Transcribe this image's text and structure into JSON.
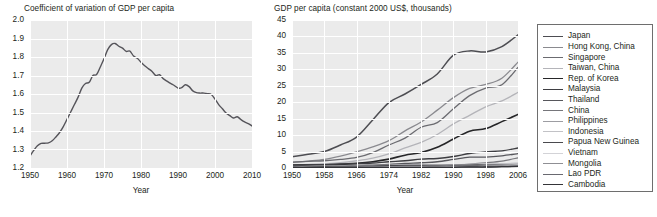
{
  "figure": {
    "background": "#ffffff",
    "plot_background": "#ebebeb",
    "gridline_color": "#ffffff",
    "text_color": "#231f20"
  },
  "chart_data": [
    {
      "id": "left",
      "type": "line",
      "title": "Coefficient of variation of GDP per capita",
      "xlabel": "Year",
      "ylabel": "",
      "xlim": [
        1950,
        2010
      ],
      "ylim": [
        1.2,
        2.0
      ],
      "xticks": [
        1950,
        1960,
        1970,
        1980,
        1990,
        2000,
        2010
      ],
      "xtick_labels": [
        "1950",
        "1960",
        "1970",
        "1980",
        "1990",
        "2000",
        "2010"
      ],
      "yticks": [
        1.2,
        1.3,
        1.4,
        1.5,
        1.6,
        1.7,
        1.8,
        1.9,
        2.0
      ],
      "ytick_labels": [
        "1.2",
        "1.3",
        "1.4",
        "1.5",
        "1.6",
        "1.7",
        "1.8",
        "1.9",
        "2.0"
      ],
      "grid": true,
      "legend": false,
      "series": [
        {
          "name": "Coefficient of variation of GDP per capita",
          "color": "#55545a",
          "width": 1.4,
          "x": [
            1950,
            1951,
            1952,
            1953,
            1954,
            1955,
            1956,
            1957,
            1958,
            1959,
            1960,
            1961,
            1962,
            1963,
            1964,
            1965,
            1966,
            1967,
            1968,
            1969,
            1970,
            1971,
            1972,
            1973,
            1974,
            1975,
            1976,
            1977,
            1978,
            1979,
            1980,
            1981,
            1982,
            1983,
            1984,
            1985,
            1986,
            1987,
            1988,
            1989,
            1990,
            1991,
            1992,
            1993,
            1994,
            1995,
            1996,
            1997,
            1998,
            1999,
            2000,
            2001,
            2002,
            2003,
            2004,
            2005,
            2006
          ],
          "values": [
            1.265,
            1.295,
            1.32,
            1.333,
            1.334,
            1.336,
            1.347,
            1.368,
            1.392,
            1.424,
            1.463,
            1.503,
            1.543,
            1.583,
            1.632,
            1.657,
            1.663,
            1.7,
            1.705,
            1.746,
            1.79,
            1.84,
            1.867,
            1.873,
            1.858,
            1.848,
            1.83,
            1.832,
            1.805,
            1.793,
            1.772,
            1.753,
            1.737,
            1.722,
            1.7,
            1.704,
            1.683,
            1.67,
            1.657,
            1.646,
            1.632,
            1.634,
            1.65,
            1.64,
            1.617,
            1.607,
            1.605,
            1.605,
            1.602,
            1.597,
            1.572,
            1.543,
            1.52,
            1.497,
            1.483,
            1.47,
            1.477
          ],
          "values_tail_x": [
            2007,
            2008,
            2009,
            2010,
            2011,
            2012
          ],
          "values_tail": [
            1.462,
            1.449,
            1.44,
            1.428,
            1.411,
            1.402
          ]
        }
      ]
    },
    {
      "id": "right",
      "type": "line",
      "title": "GDP per capita (constant 2000 US$, thousands)",
      "xlabel": "Year",
      "ylabel": "",
      "xlim": [
        1950,
        2006
      ],
      "ylim": [
        0,
        45
      ],
      "xticks": [
        1950,
        1958,
        1966,
        1974,
        1982,
        1990,
        1998,
        2006
      ],
      "xtick_labels": [
        "1950",
        "1958",
        "1966",
        "1974",
        "1982",
        "1990",
        "1998",
        "2006"
      ],
      "yticks": [
        0,
        5,
        10,
        15,
        20,
        25,
        30,
        35,
        40,
        45
      ],
      "ytick_labels": [
        "0",
        "5",
        "10",
        "15",
        "20",
        "25",
        "30",
        "35",
        "40",
        "45"
      ],
      "grid": true,
      "legend": true,
      "x": [
        1950,
        1954,
        1958,
        1962,
        1966,
        1970,
        1974,
        1978,
        1982,
        1986,
        1990,
        1994,
        1998,
        2002,
        2006
      ],
      "series": [
        {
          "name": "Japan",
          "color": "#4d4d52",
          "width": 1.5,
          "values": [
            3.4,
            4.2,
            5.0,
            7.0,
            9.4,
            14.6,
            19.9,
            22.5,
            25.4,
            28.6,
            34.3,
            35.6,
            35.3,
            36.9,
            40.5
          ]
        },
        {
          "name": "Hong Kong, China",
          "color": "#8a8a8f",
          "width": 1.3,
          "values": [
            1.7,
            2.1,
            2.6,
            3.6,
            4.9,
            6.4,
            8.3,
            11.3,
            14.0,
            17.6,
            21.4,
            24.2,
            25.4,
            27.3,
            32.2
          ]
        },
        {
          "name": "Singapore",
          "color": "#6b6b70",
          "width": 1.3,
          "values": [
            1.8,
            2.0,
            2.2,
            2.6,
            3.2,
            4.7,
            7.0,
            9.1,
            12.4,
            13.8,
            18.0,
            22.0,
            24.3,
            25.3,
            30.6
          ]
        },
        {
          "name": "Taiwan, China",
          "color": "#b4b4b9",
          "width": 1.3,
          "values": [
            0.9,
            1.1,
            1.3,
            1.6,
            2.2,
            3.0,
            4.3,
            6.1,
            7.8,
            10.2,
            13.4,
            16.0,
            18.6,
            20.4,
            23.0
          ]
        },
        {
          "name": "Rep. of Korea",
          "color": "#262628",
          "width": 1.6,
          "values": [
            0.8,
            0.9,
            1.0,
            1.1,
            1.4,
            1.9,
            2.7,
            3.9,
            4.7,
            6.3,
            8.8,
            11.2,
            12.0,
            14.1,
            16.3
          ]
        },
        {
          "name": "Malaysia",
          "color": "#3e3e42",
          "width": 1.4,
          "values": [
            0.9,
            1.0,
            1.0,
            1.2,
            1.3,
            1.5,
            1.9,
            2.2,
            2.7,
            2.9,
            3.5,
            4.4,
            4.9,
            5.2,
            6.1
          ]
        },
        {
          "name": "Thailand",
          "color": "#57575c",
          "width": 1.3,
          "values": [
            0.4,
            0.4,
            0.5,
            0.6,
            0.7,
            0.9,
            1.1,
            1.4,
            1.6,
            1.9,
            2.6,
            3.3,
            3.3,
            3.7,
            4.4
          ]
        },
        {
          "name": "China",
          "color": "#76767b",
          "width": 1.2,
          "values": [
            0.1,
            0.1,
            0.2,
            0.2,
            0.2,
            0.2,
            0.3,
            0.3,
            0.4,
            0.6,
            0.8,
            1.2,
            1.6,
            2.1,
            3.1
          ]
        },
        {
          "name": "Philippines",
          "color": "#9d9da2",
          "width": 1.2,
          "values": [
            0.5,
            0.5,
            0.6,
            0.6,
            0.7,
            0.8,
            0.9,
            1.0,
            1.1,
            0.9,
            1.0,
            1.0,
            1.1,
            1.1,
            1.3
          ]
        },
        {
          "name": "Indonesia",
          "color": "#c2c2c6",
          "width": 1.2,
          "values": [
            0.3,
            0.3,
            0.3,
            0.3,
            0.3,
            0.4,
            0.5,
            0.6,
            0.7,
            0.8,
            0.9,
            1.2,
            1.2,
            1.3,
            1.5
          ]
        },
        {
          "name": "Papua New Guinea",
          "color": "#4a4a4e",
          "width": 1.3,
          "values": [
            0.3,
            0.3,
            0.4,
            0.4,
            0.5,
            0.6,
            0.7,
            0.7,
            0.7,
            0.8,
            0.8,
            0.9,
            0.9,
            0.8,
            0.8
          ]
        },
        {
          "name": "Vietnam",
          "color": "#d3d3d7",
          "width": 1.2,
          "values": [
            0.1,
            0.1,
            0.1,
            0.1,
            0.1,
            0.1,
            0.2,
            0.2,
            0.2,
            0.2,
            0.3,
            0.4,
            0.5,
            0.6,
            0.8
          ]
        },
        {
          "name": "Mongolia",
          "color": "#8f8f94",
          "width": 1.2,
          "values": [
            0.2,
            0.2,
            0.2,
            0.3,
            0.3,
            0.4,
            0.4,
            0.5,
            0.5,
            0.6,
            0.6,
            0.4,
            0.4,
            0.5,
            0.7
          ]
        },
        {
          "name": "Lao PDR",
          "color": "#696970",
          "width": 1.2,
          "values": [
            0.1,
            0.1,
            0.1,
            0.1,
            0.1,
            0.2,
            0.2,
            0.2,
            0.2,
            0.2,
            0.2,
            0.3,
            0.3,
            0.4,
            0.5
          ]
        },
        {
          "name": "Cambodia",
          "color": "#343438",
          "width": 1.3,
          "values": [
            0.1,
            0.1,
            0.2,
            0.2,
            0.2,
            0.2,
            0.1,
            0.1,
            0.1,
            0.2,
            0.2,
            0.3,
            0.3,
            0.4,
            0.5
          ]
        }
      ]
    }
  ],
  "legend": {
    "items": [
      {
        "label": "Japan",
        "color": "#4d4d52",
        "width": 1.5
      },
      {
        "label": "Hong Kong, China",
        "color": "#8a8a8f",
        "width": 1.3
      },
      {
        "label": "Singapore",
        "color": "#6b6b70",
        "width": 1.3
      },
      {
        "label": "Taiwan, China",
        "color": "#b4b4b9",
        "width": 1.3
      },
      {
        "label": "Rep. of Korea",
        "color": "#262628",
        "width": 1.6
      },
      {
        "label": "Malaysia",
        "color": "#3e3e42",
        "width": 1.4
      },
      {
        "label": "Thailand",
        "color": "#57575c",
        "width": 1.3
      },
      {
        "label": "China",
        "color": "#76767b",
        "width": 1.2
      },
      {
        "label": "Philippines",
        "color": "#9d9da2",
        "width": 1.2
      },
      {
        "label": "Indonesia",
        "color": "#c2c2c6",
        "width": 1.2
      },
      {
        "label": "Papua New Guinea",
        "color": "#4a4a4e",
        "width": 1.3
      },
      {
        "label": "Vietnam",
        "color": "#d3d3d7",
        "width": 1.2
      },
      {
        "label": "Mongolia",
        "color": "#8f8f94",
        "width": 1.2
      },
      {
        "label": "Lao PDR",
        "color": "#696970",
        "width": 1.2
      },
      {
        "label": "Cambodia",
        "color": "#343438",
        "width": 1.3
      }
    ]
  }
}
